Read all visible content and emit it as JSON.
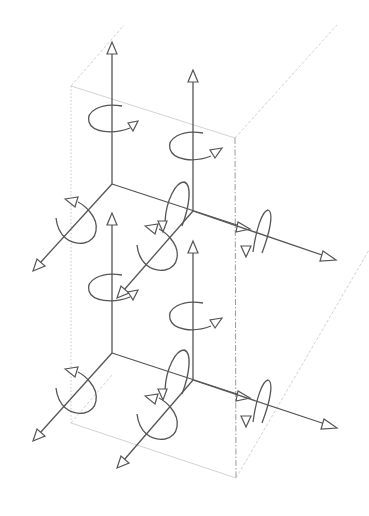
{
  "diagram": {
    "colors": {
      "line": "#555555",
      "box_edge": "#c8c8c8",
      "background": "#ffffff"
    },
    "box": {
      "front_top_left": [
        71,
        86
      ],
      "front_top_right": [
        235,
        138
      ],
      "front_bottom_left": [
        71,
        423
      ],
      "front_bottom_right": [
        236,
        478
      ],
      "back_top_left": [
        124,
        25
      ],
      "back_top_right": [
        337,
        25
      ],
      "back_bottom_right": [
        369,
        250
      ]
    },
    "nodes": [
      {
        "name": "upper-left-node",
        "origin": [
          112,
          184
        ],
        "z_tip": [
          112,
          42
        ],
        "x_tip": [
          248,
          228
        ],
        "y_tip": [
          33,
          270
        ]
      },
      {
        "name": "upper-right-node",
        "origin": [
          193,
          211
        ],
        "z_tip": [
          193,
          70
        ],
        "x_tip": [
          335,
          260
        ],
        "y_tip": [
          117,
          298
        ]
      },
      {
        "name": "lower-left-node",
        "origin": [
          112,
          353
        ],
        "z_tip": [
          112,
          213
        ],
        "x_tip": [
          248,
          398
        ],
        "y_tip": [
          33,
          440
        ]
      },
      {
        "name": "lower-right-node",
        "origin": [
          193,
          380
        ],
        "z_tip": [
          193,
          241
        ],
        "x_tip": [
          336,
          428
        ],
        "y_tip": [
          117,
          468
        ]
      }
    ],
    "labels": []
  }
}
